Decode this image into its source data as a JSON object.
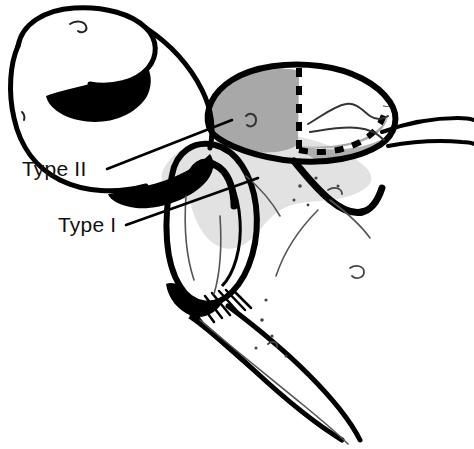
{
  "figure": {
    "kind": "anatomical-line-drawing",
    "background_color": "#ffffff",
    "ink_color": "#000000",
    "canvas": {
      "width": 474,
      "height": 449
    }
  },
  "regions": {
    "type_ii": {
      "name": "Type II region",
      "fill_color": "#a8a8a8",
      "description": "dark gray shaded oval at upper right of the humeral head",
      "boundary_style": "dashed"
    },
    "type_i": {
      "name": "Type I region",
      "fill_color": "#e2e2e2",
      "description": "light gray shaded area below and right of the glenoid rim",
      "boundary_style": "solid"
    }
  },
  "labels": [
    {
      "id": "type-ii",
      "text": "Type II",
      "x": 22,
      "y": 176,
      "leader_from": [
        107,
        169
      ],
      "leader_to": [
        232,
        120
      ]
    },
    {
      "id": "type-i",
      "text": "Type I",
      "x": 58,
      "y": 232,
      "leader_from": [
        126,
        225
      ],
      "leader_to": [
        258,
        178
      ]
    }
  ]
}
